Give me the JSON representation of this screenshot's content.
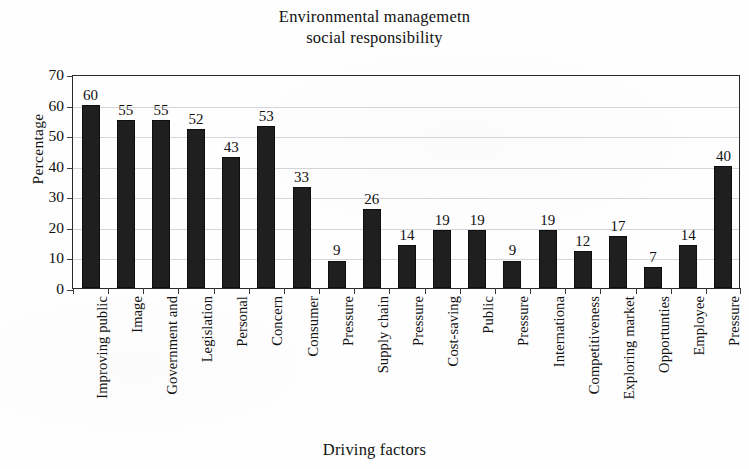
{
  "chart_data": {
    "type": "bar",
    "title": "Environmental managemetn social responsibility",
    "title_lines": [
      "Environmental managemetn",
      "social responsibility"
    ],
    "xlabel": "Driving factors",
    "ylabel": "Percentage",
    "ylim": [
      0,
      70
    ],
    "ytick_step": 10,
    "yticks": [
      0,
      10,
      20,
      30,
      40,
      50,
      60,
      70
    ],
    "grid": true,
    "legend": null,
    "bar_color": "#201f1f",
    "categories": [
      "Improving public",
      "Image",
      "Government and",
      "Legislation",
      "Personal",
      "Concern",
      "Consumer",
      "Pressure",
      "Supply chain",
      "Pressure",
      "Cost-saving",
      "Public",
      "Pressure",
      "Internationa",
      "Competitiveness",
      "Exploring market",
      "Opportunties",
      "Employee",
      "Pressure"
    ],
    "values": [
      60,
      55,
      55,
      52,
      43,
      53,
      33,
      9,
      26,
      14,
      19,
      19,
      9,
      19,
      12,
      17,
      7,
      14,
      40
    ],
    "value_labels": [
      "60",
      "55",
      "55",
      "52",
      "43",
      "53",
      "33",
      "9",
      "26",
      "14",
      "19",
      "19",
      "9",
      "19",
      "12",
      "17",
      "7",
      "14",
      "40"
    ]
  }
}
